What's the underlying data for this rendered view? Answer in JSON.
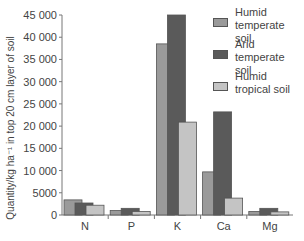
{
  "chart_data": {
    "type": "bar",
    "title": "",
    "xlabel": "",
    "ylabel": "Quantity/kg ha⁻¹ in top 20 cm layer of soil",
    "ylim": [
      0,
      45000
    ],
    "yticks": [
      0,
      5000,
      10000,
      15000,
      20000,
      25000,
      30000,
      35000,
      40000,
      45000
    ],
    "ytick_labels": [
      "0",
      "5000",
      "10 000",
      "15 000",
      "20 000",
      "25 000",
      "30 000",
      "35 000",
      "40 000",
      "45 000"
    ],
    "categories": [
      "N",
      "P",
      "K",
      "Ca",
      "Mg"
    ],
    "series": [
      {
        "name": "Humid temperate soil",
        "color": "#9a9a9a",
        "values": [
          3400,
          1000,
          38500,
          9700,
          800
        ]
      },
      {
        "name": "Arid temperate soil",
        "color": "#5a5a5a",
        "values": [
          2700,
          1500,
          45000,
          23200,
          1500
        ]
      },
      {
        "name": "Humid tropical soil",
        "color": "#c4c4c4",
        "values": [
          2200,
          800,
          20900,
          3800,
          700
        ]
      }
    ],
    "grid": false,
    "legend_position": "upper right"
  },
  "legend": {
    "items": [
      {
        "label": "Humid\ntemperate soil",
        "color": "#9a9a9a"
      },
      {
        "label": "Arid\ntemperate soil",
        "color": "#5a5a5a"
      },
      {
        "label": "Humid\ntropical soil",
        "color": "#c4c4c4"
      }
    ]
  }
}
